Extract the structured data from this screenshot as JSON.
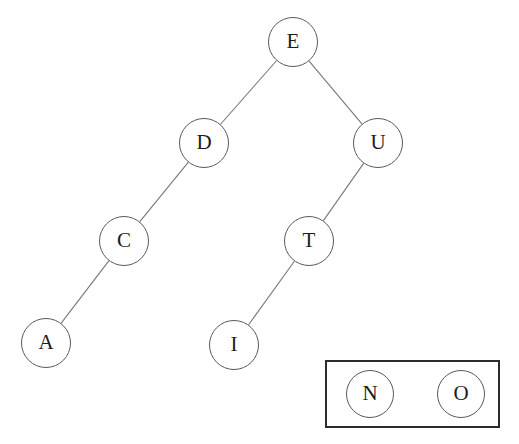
{
  "diagram": {
    "background_color": "#ffffff",
    "node_stroke_color": "#59595c",
    "node_text_color": "#1c1c1c",
    "edge_color": "#77777a",
    "group_box_color": "#2b2b2b",
    "node_radius": 25,
    "nodes": [
      {
        "id": "E",
        "label": "E",
        "cx": 293,
        "cy": 42,
        "r": 25
      },
      {
        "id": "D",
        "label": "D",
        "cx": 204,
        "cy": 143,
        "r": 25
      },
      {
        "id": "U",
        "label": "U",
        "cx": 378,
        "cy": 143,
        "r": 25
      },
      {
        "id": "C",
        "label": "C",
        "cx": 124,
        "cy": 241,
        "r": 25
      },
      {
        "id": "T",
        "label": "T",
        "cx": 309,
        "cy": 241,
        "r": 25
      },
      {
        "id": "A",
        "label": "A",
        "cx": 46,
        "cy": 343,
        "r": 25
      },
      {
        "id": "I",
        "label": "I",
        "cx": 234,
        "cy": 345,
        "r": 25
      }
    ],
    "edges": [
      {
        "from": "E",
        "to": "D"
      },
      {
        "from": "E",
        "to": "U"
      },
      {
        "from": "D",
        "to": "C"
      },
      {
        "from": "C",
        "to": "A"
      },
      {
        "from": "U",
        "to": "T"
      },
      {
        "from": "T",
        "to": "I"
      }
    ],
    "group_box": {
      "x": 325,
      "y": 360,
      "width": 175,
      "height": 68,
      "nodes": [
        {
          "id": "N",
          "label": "N",
          "cx": 370,
          "cy": 394,
          "r": 24
        },
        {
          "id": "O",
          "label": "O",
          "cx": 461,
          "cy": 394,
          "r": 24
        }
      ]
    }
  }
}
